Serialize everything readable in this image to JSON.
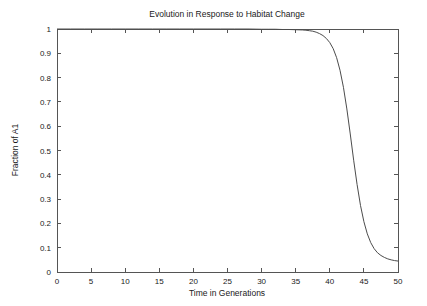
{
  "chart_data": {
    "type": "line",
    "title": "Evolution in Response to Habitat Change",
    "xlabel": "Time in Generations",
    "ylabel": "Fraction of A1",
    "xlim": [
      0,
      50
    ],
    "ylim": [
      0,
      1
    ],
    "grid": false,
    "legend": null,
    "xticks": [
      "0",
      "5",
      "10",
      "15",
      "20",
      "25",
      "30",
      "35",
      "40",
      "45",
      "50"
    ],
    "xtick_values": [
      0,
      5,
      10,
      15,
      20,
      25,
      30,
      35,
      40,
      45,
      50
    ],
    "yticks": [
      "0",
      "0.1",
      "0.2",
      "0.3",
      "0.4",
      "0.5",
      "0.6",
      "0.7",
      "0.8",
      "0.9",
      "1"
    ],
    "ytick_values": [
      0,
      0.1,
      0.2,
      0.3,
      0.4,
      0.5,
      0.6,
      0.7,
      0.8,
      0.9,
      1
    ],
    "line_color": "#4c4c4c",
    "series": [
      {
        "name": "Fraction of A1",
        "x": [
          0,
          2,
          4,
          6,
          8,
          10,
          12,
          14,
          16,
          18,
          20,
          22,
          24,
          26,
          28,
          30,
          31,
          32,
          33,
          34,
          35,
          36,
          36.5,
          37,
          37.5,
          38,
          38.5,
          39,
          39.5,
          40,
          40.5,
          41,
          41.5,
          42,
          42.5,
          43,
          43.5,
          44,
          44.5,
          45,
          45.5,
          46,
          46.5,
          47,
          47.5,
          48,
          48.5,
          49,
          49.5,
          50
        ],
        "values": [
          1.0,
          1.0,
          1.0,
          1.0,
          1.0,
          1.0,
          1.0,
          1.0,
          1.0,
          1.0,
          1.0,
          1.0,
          1.0,
          1.0,
          1.0,
          0.999,
          0.999,
          0.999,
          0.998,
          0.998,
          0.997,
          0.996,
          0.995,
          0.993,
          0.991,
          0.987,
          0.981,
          0.973,
          0.961,
          0.944,
          0.919,
          0.882,
          0.83,
          0.76,
          0.671,
          0.568,
          0.46,
          0.36,
          0.274,
          0.207,
          0.157,
          0.121,
          0.096,
          0.079,
          0.068,
          0.06,
          0.054,
          0.05,
          0.047,
          0.045
        ]
      }
    ]
  },
  "figure": {
    "background_color": "#ffffff",
    "axis_color": "#555555"
  }
}
